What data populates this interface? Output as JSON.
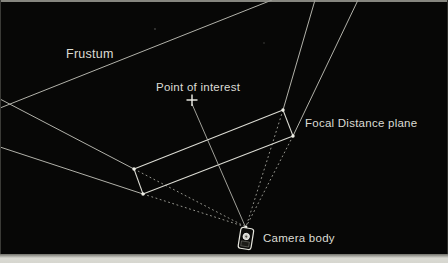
{
  "figure": {
    "colors": {
      "background": "#070706",
      "solid_line": "#b2b2aa",
      "focal_plane_line": "#dcdcd4",
      "dotted_line": "#a5a59d",
      "label_text": "#dcdcd4",
      "page_strip": "#d6d6cf"
    },
    "labels": {
      "frustum": "Frustum",
      "point_of_interest": "Point of interest",
      "focal_distance_plane": "Focal Distance plane",
      "camera_body": "Camera body"
    },
    "lines": [
      {
        "name": "far-plane-edge-line",
        "x1": 0,
        "y1": 108,
        "x2": 272,
        "y2": 0,
        "kind": "solid"
      },
      {
        "name": "frustum-edge-upper-left-outer",
        "x1": 0,
        "y1": 99,
        "x2": 134,
        "y2": 169,
        "kind": "solid"
      },
      {
        "name": "frustum-edge-upper-left-inner",
        "x1": 134,
        "y1": 169,
        "x2": 246,
        "y2": 227,
        "kind": "dotted"
      },
      {
        "name": "frustum-edge-lower-left-outer",
        "x1": 0,
        "y1": 147,
        "x2": 143,
        "y2": 194,
        "kind": "solid"
      },
      {
        "name": "frustum-edge-lower-left-inner",
        "x1": 143,
        "y1": 194,
        "x2": 246,
        "y2": 227,
        "kind": "dotted"
      },
      {
        "name": "frustum-edge-upper-right-outer",
        "x1": 315,
        "y1": 0,
        "x2": 283,
        "y2": 110,
        "kind": "solid"
      },
      {
        "name": "frustum-edge-upper-right-inner",
        "x1": 283,
        "y1": 110,
        "x2": 246,
        "y2": 227,
        "kind": "dotted"
      },
      {
        "name": "frustum-edge-lower-right-outer",
        "x1": 358,
        "y1": 0,
        "x2": 293,
        "y2": 136,
        "kind": "solid"
      },
      {
        "name": "frustum-edge-lower-right-inner",
        "x1": 293,
        "y1": 136,
        "x2": 246,
        "y2": 227,
        "kind": "dotted"
      },
      {
        "name": "focal-plane-top-edge",
        "x1": 134,
        "y1": 169,
        "x2": 283,
        "y2": 110,
        "kind": "bright"
      },
      {
        "name": "focal-plane-right-edge",
        "x1": 283,
        "y1": 110,
        "x2": 293,
        "y2": 136,
        "kind": "bright"
      },
      {
        "name": "focal-plane-bottom-edge",
        "x1": 293,
        "y1": 136,
        "x2": 143,
        "y2": 194,
        "kind": "bright"
      },
      {
        "name": "focal-plane-left-edge",
        "x1": 143,
        "y1": 194,
        "x2": 134,
        "y2": 169,
        "kind": "bright"
      },
      {
        "name": "point-of-interest-sight-line",
        "x1": 192,
        "y1": 104,
        "x2": 245,
        "y2": 226,
        "kind": "sight"
      },
      {
        "name": "point-of-interest-marker-vertical",
        "x1": 192,
        "y1": 94.5,
        "x2": 192,
        "y2": 106,
        "kind": "marker"
      },
      {
        "name": "point-of-interest-marker-horizontal",
        "x1": 186.5,
        "y1": 100,
        "x2": 197.5,
        "y2": 100,
        "kind": "marker"
      }
    ],
    "nodes": [
      {
        "name": "focal-plane-corner-left-top",
        "x": 134,
        "y": 169,
        "r": 1.7
      },
      {
        "name": "focal-plane-corner-left-bottom",
        "x": 143,
        "y": 194,
        "r": 1.7
      },
      {
        "name": "focal-plane-corner-right-top",
        "x": 283,
        "y": 110,
        "r": 1.7
      },
      {
        "name": "focal-plane-corner-right-bottom",
        "x": 293,
        "y": 136,
        "r": 1.7
      },
      {
        "name": "camera-apex-node",
        "x": 246,
        "y": 227,
        "r": 1.4
      }
    ],
    "specks": [
      {
        "name": "scan-speck",
        "x": 155,
        "y": 29,
        "r": 0.9
      },
      {
        "name": "scan-speck",
        "x": 264,
        "y": 43,
        "r": 0.8
      }
    ]
  }
}
